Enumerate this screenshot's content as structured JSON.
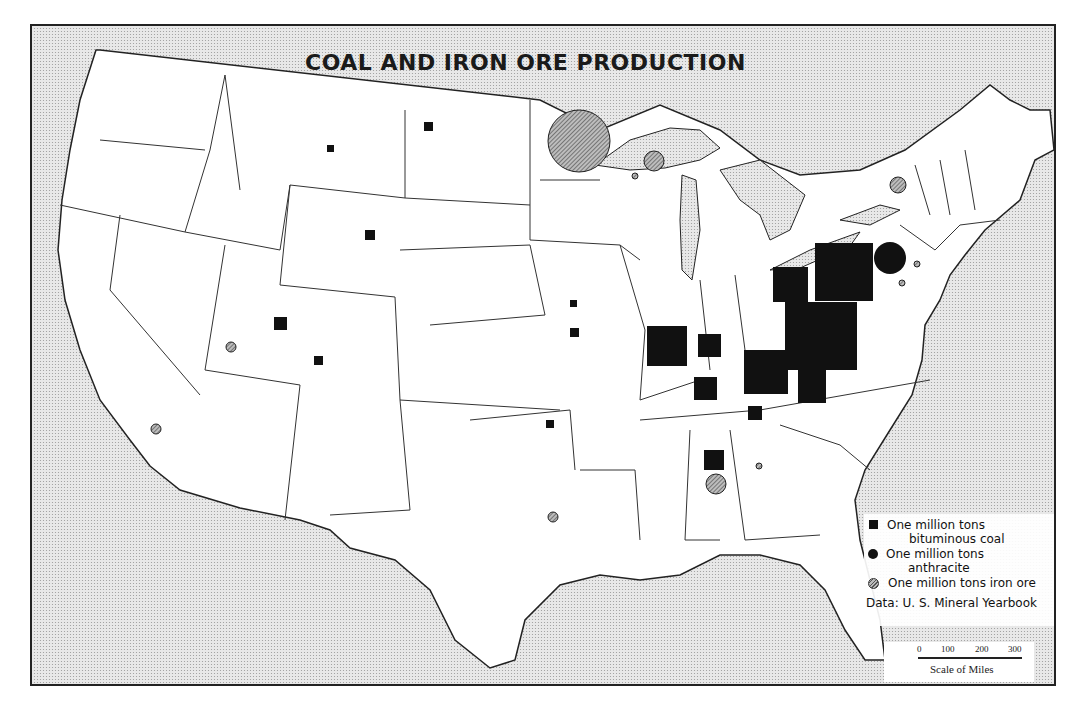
{
  "title": "COAL AND IRON ORE PRODUCTION",
  "legend": {
    "items": [
      {
        "symbol": "black-square",
        "line1": "One million tons",
        "line2": "bituminous coal"
      },
      {
        "symbol": "black-circle",
        "line1": "One million tons",
        "line2": "anthracite"
      },
      {
        "symbol": "hatched-circle",
        "line1": "One million tons iron ore",
        "line2": ""
      }
    ],
    "source": "Data: U. S. Mineral Yearbook"
  },
  "scale": {
    "ticks": [
      "0",
      "100",
      "200",
      "300"
    ],
    "label": "Scale of Miles"
  },
  "symbols": {
    "coal": [
      {
        "x": 428,
        "y": 126,
        "s": 9
      },
      {
        "x": 330,
        "y": 148,
        "s": 7
      },
      {
        "x": 370,
        "y": 235,
        "s": 10
      },
      {
        "x": 281,
        "y": 324,
        "s": 13
      },
      {
        "x": 319,
        "y": 361,
        "s": 9
      },
      {
        "x": 574,
        "y": 303,
        "s": 7
      },
      {
        "x": 574,
        "y": 332,
        "s": 9
      },
      {
        "x": 550,
        "y": 424,
        "s": 8
      },
      {
        "x": 667,
        "y": 346,
        "s": 40
      },
      {
        "x": 709,
        "y": 345,
        "s": 23
      },
      {
        "x": 706,
        "y": 388,
        "s": 23
      },
      {
        "x": 766,
        "y": 373,
        "s": 44
      },
      {
        "x": 755,
        "y": 413,
        "s": 14
      },
      {
        "x": 790,
        "y": 284,
        "s": 33
      },
      {
        "x": 844,
        "y": 271,
        "s": 58
      },
      {
        "x": 821,
        "y": 337,
        "s": 70
      },
      {
        "x": 812,
        "y": 385,
        "s": 28
      },
      {
        "x": 714,
        "y": 460,
        "s": 20
      }
    ],
    "anthracite": [
      {
        "x": 890,
        "y": 258,
        "r": 16
      }
    ],
    "iron": [
      {
        "x": 579,
        "y": 141,
        "r": 31
      },
      {
        "x": 654,
        "y": 161,
        "r": 10
      },
      {
        "x": 635,
        "y": 176,
        "r": 3
      },
      {
        "x": 898,
        "y": 185,
        "r": 8
      },
      {
        "x": 917,
        "y": 264,
        "r": 3
      },
      {
        "x": 902,
        "y": 283,
        "r": 3
      },
      {
        "x": 231,
        "y": 347,
        "r": 5
      },
      {
        "x": 156,
        "y": 429,
        "r": 5
      },
      {
        "x": 716,
        "y": 484,
        "r": 10
      },
      {
        "x": 759,
        "y": 466,
        "r": 3
      },
      {
        "x": 553,
        "y": 517,
        "r": 5
      }
    ]
  },
  "colors": {
    "land": "#ffffff",
    "water": "#e3e3e3",
    "ink": "#111111"
  }
}
